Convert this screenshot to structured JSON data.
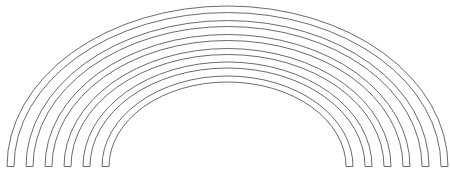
{
  "figure": {
    "width": 450,
    "height": 174,
    "background": "#ffffff",
    "stroke_color": "#6b6b6b",
    "stroke_width": 1,
    "center": {
      "x": 227.5,
      "y": 166.5
    },
    "bands": [
      {
        "name": "band-1",
        "outer": {
          "rx": 220.5,
          "ry": 160.5
        },
        "inner": {
          "rx": 213.5,
          "ry": 154
        }
      },
      {
        "name": "band-2",
        "outer": {
          "rx": 201.5,
          "ry": 146
        },
        "inner": {
          "rx": 194.5,
          "ry": 140
        }
      },
      {
        "name": "band-3",
        "outer": {
          "rx": 182.5,
          "ry": 132
        },
        "inner": {
          "rx": 175.5,
          "ry": 126
        }
      },
      {
        "name": "band-4",
        "outer": {
          "rx": 163.5,
          "ry": 118
        },
        "inner": {
          "rx": 156.5,
          "ry": 112
        }
      },
      {
        "name": "band-5",
        "outer": {
          "rx": 144.5,
          "ry": 104.5
        },
        "inner": {
          "rx": 137.5,
          "ry": 98.5
        }
      },
      {
        "name": "band-6",
        "outer": {
          "rx": 125.5,
          "ry": 90.5
        },
        "inner": {
          "rx": 118.5,
          "ry": 84.5
        }
      }
    ]
  }
}
